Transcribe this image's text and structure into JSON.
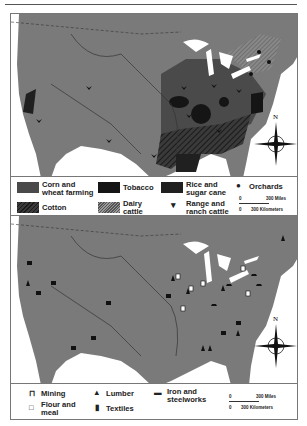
{
  "map_top": {
    "title": "Agriculture",
    "legend": [
      {
        "label_line1": "Corn and",
        "label_line2": "wheat farming",
        "symbol": "corn-wheat-swatch",
        "color": "#4a4a4a"
      },
      {
        "label_line1": "Tobacco",
        "label_line2": "",
        "symbol": "tobacco-swatch",
        "color": "#151515"
      },
      {
        "label_line1": "Rice and",
        "label_line2": "sugar cane",
        "symbol": "rice-sugar-swatch",
        "color": "#202020"
      },
      {
        "label_line1": "Orchards",
        "label_line2": "",
        "symbol": "apple-icon"
      },
      {
        "label_line1": "Cotton",
        "label_line2": "",
        "symbol": "cotton-hatch-swatch"
      },
      {
        "label_line1": "Dairy",
        "label_line2": "cattle",
        "symbol": "dairy-hatch-swatch"
      },
      {
        "label_line1": "Range and",
        "label_line2": "ranch cattle",
        "symbol": "cattle-horns-icon"
      }
    ],
    "scale": {
      "miles": "300 Miles",
      "km": "300 Kilometers",
      "zero": "0"
    },
    "compass": "N"
  },
  "map_bottom": {
    "title": "Industry",
    "legend": [
      {
        "label_line1": "Mining",
        "label_line2": "",
        "symbol": "mining-icon"
      },
      {
        "label_line1": "Lumber",
        "label_line2": "",
        "symbol": "lumber-tree-icon"
      },
      {
        "label_line1": "Iron and",
        "label_line2": "steelworks",
        "symbol": "iron-steel-icon"
      },
      {
        "label_line1": "Flour and",
        "label_line2": "meal",
        "symbol": "flour-sack-icon"
      },
      {
        "label_line1": "Textiles",
        "label_line2": "",
        "symbol": "textiles-spool-icon"
      }
    ],
    "scale": {
      "miles": "300 Miles",
      "km": "300 Kilometers",
      "zero": "0"
    },
    "compass": "N"
  },
  "colors": {
    "land": "#7a7a7a",
    "water": "#ffffff",
    "border": "#777777",
    "ink": "#222222"
  }
}
